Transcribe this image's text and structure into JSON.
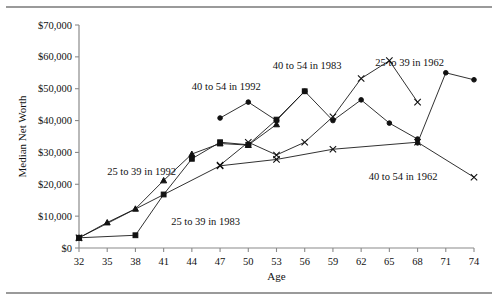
{
  "figure": {
    "has_top_rule": true,
    "has_bottom_rule": true
  },
  "chart_data": {
    "type": "line",
    "title": "",
    "xlabel": "Age",
    "ylabel": "Median Net Worth",
    "xlim": [
      32,
      74
    ],
    "ylim": [
      0,
      70000
    ],
    "grid": false,
    "legend_position": "inline-annotations",
    "x_ticks": [
      32,
      35,
      38,
      41,
      44,
      47,
      50,
      53,
      56,
      59,
      62,
      65,
      68,
      71,
      74
    ],
    "x_tick_labels": [
      "32",
      "35",
      "38",
      "41",
      "44",
      "47",
      "50",
      "53",
      "56",
      "59",
      "62",
      "65",
      "68",
      "71",
      "74"
    ],
    "y_ticks": [
      0,
      10000,
      20000,
      30000,
      40000,
      50000,
      60000,
      70000
    ],
    "y_tick_labels": [
      "$0",
      "$10,000",
      "$20,000",
      "$30,000",
      "$40,000",
      "$50,000",
      "$60,000",
      "$70,000"
    ],
    "series": [
      {
        "name": "25 to 39 in 1983",
        "marker": "square",
        "label": "25 to 39 in 1983",
        "label_x": 41.8,
        "label_y": 7200,
        "x": [
          32,
          38,
          41,
          44,
          47,
          50,
          53,
          56
        ],
        "y": [
          3200,
          4000,
          16800,
          28000,
          33200,
          32400,
          40300,
          49200
        ]
      },
      {
        "name": "25 to 39 in 1992",
        "marker": "triangle",
        "label": "25 to 39 in 1992",
        "label_x": 35.0,
        "label_y": 22800,
        "x": [
          32,
          35,
          38,
          41,
          44,
          47,
          50,
          53
        ],
        "y": [
          3200,
          8000,
          12300,
          21200,
          29500,
          32800,
          32300,
          38800
        ]
      },
      {
        "name": "40 to 54 in 1992",
        "marker": "circle",
        "label": "40 to 54 in 1992",
        "label_x": 44.0,
        "label_y": 49500,
        "x": [
          47,
          50,
          53,
          56,
          59,
          62,
          65,
          68
        ],
        "y": [
          40800,
          45800,
          40000,
          49200,
          40000,
          46500,
          39200,
          34200
        ]
      },
      {
        "name": "40 to 54 in 1983",
        "marker": "x",
        "label": "40 to 54 in 1983",
        "label_x": 52.6,
        "label_y": 56200,
        "x": [
          47,
          50,
          53,
          56,
          59,
          62,
          65,
          68
        ],
        "y": [
          26000,
          33200,
          29200,
          33200,
          41200,
          53200,
          58800,
          45800
        ]
      },
      {
        "name": "25 to 39 in 1962",
        "marker": "circle",
        "label": "25 to 39 in 1962",
        "label_x": 63.5,
        "label_y": 57200,
        "x": [
          68,
          71,
          74
        ],
        "y": [
          33000,
          55000,
          52800
        ]
      },
      {
        "name": "40 to 54 in 1962",
        "marker": "x",
        "label": "40 to 54 in 1962",
        "label_x": 62.8,
        "label_y": 21200,
        "x": [
          32,
          47,
          53,
          59,
          68,
          74
        ],
        "y": [
          3200,
          25800,
          27800,
          31000,
          33200,
          22200
        ]
      }
    ]
  }
}
